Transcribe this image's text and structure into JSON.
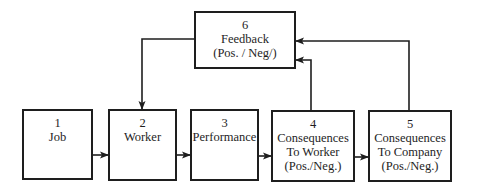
{
  "diagram": {
    "type": "flowchart",
    "nodes": [
      {
        "id": "1",
        "number": "1",
        "lines": [
          "Job"
        ]
      },
      {
        "id": "2",
        "number": "2",
        "lines": [
          "Worker"
        ]
      },
      {
        "id": "3",
        "number": "3",
        "lines": [
          "Performance"
        ]
      },
      {
        "id": "4",
        "number": "4",
        "lines": [
          "Consequences",
          "To Worker",
          "(Pos./Neg.)"
        ]
      },
      {
        "id": "5",
        "number": "5",
        "lines": [
          "Consequences",
          "To Company",
          "(Pos./Neg.)"
        ]
      },
      {
        "id": "6",
        "number": "6",
        "lines": [
          "Feedback",
          "(Pos. / Neg/)"
        ]
      }
    ],
    "edges": [
      {
        "from": "1",
        "to": "2"
      },
      {
        "from": "2",
        "to": "3"
      },
      {
        "from": "3",
        "to": "4"
      },
      {
        "from": "4",
        "to": "5"
      },
      {
        "from": "4",
        "to": "6"
      },
      {
        "from": "5",
        "to": "6"
      },
      {
        "from": "6",
        "to": "2"
      }
    ],
    "colors": {
      "stroke": "#1e1e1e",
      "background": "#ffffff"
    }
  }
}
